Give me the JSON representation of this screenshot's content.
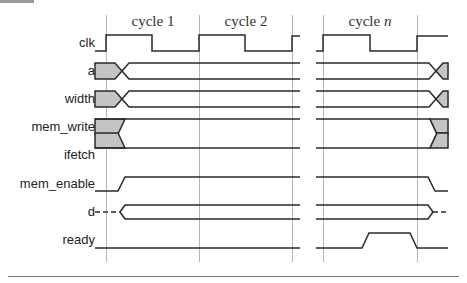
{
  "cycles": [
    {
      "prefix": "cycle",
      "number": "1"
    },
    {
      "prefix": "cycle",
      "number": "2"
    },
    {
      "prefix": "cycle",
      "number": "n"
    }
  ],
  "signals": [
    {
      "name": "clk",
      "type": "clock"
    },
    {
      "name": "a",
      "type": "bus"
    },
    {
      "name": "width",
      "type": "bus"
    },
    {
      "name": "mem_write",
      "type": "control-low"
    },
    {
      "name": "ifetch",
      "type": "control-low"
    },
    {
      "name": "mem_enable",
      "type": "control"
    },
    {
      "name": "d",
      "type": "bus-tristate"
    },
    {
      "name": "ready",
      "type": "control"
    }
  ],
  "colors": {
    "trace": "#2a2a2a",
    "gridline": "#b5b5b5",
    "undefined_fill": "#c4c4c4"
  }
}
